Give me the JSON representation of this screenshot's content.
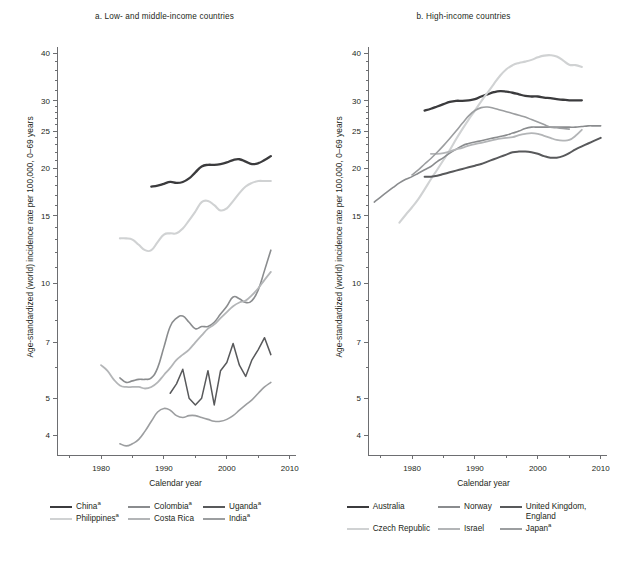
{
  "figure": {
    "background": "#ffffff",
    "text_color": "#231f20",
    "axis_color": "#6d6e71"
  },
  "axes": {
    "ylabel": "Age-standardized (world) incidence rate per 100,000, 0–69 years",
    "xlabel": "Calendar year",
    "y_ticks": [
      4,
      5,
      7,
      10,
      15,
      20,
      25,
      30,
      40
    ],
    "y_minor_ticks": [
      6,
      8,
      9,
      11,
      12,
      13,
      14,
      16,
      17,
      18,
      19,
      21,
      22,
      23,
      24,
      26,
      27,
      28,
      29,
      32,
      34,
      36,
      38
    ],
    "y_scale": "log",
    "ylim": [
      3.55,
      41.5
    ],
    "x_ticks": [
      1980,
      1990,
      2000,
      2010
    ],
    "x_minor_ticks": [
      1975,
      1985,
      1995,
      2005
    ],
    "xlim": [
      1973,
      2011
    ]
  },
  "panel_a": {
    "title": "a. Low- and middle-income countries",
    "legend": [
      {
        "label": "China",
        "superscript": "a",
        "color": "#3b3b3d",
        "width": 2.3
      },
      {
        "label": "Philippines",
        "superscript": "a",
        "color": "#d0d2d3",
        "width": 2.1
      },
      {
        "label": "Colombia",
        "superscript": "a",
        "color": "#8a8c8e",
        "width": 1.6
      },
      {
        "label": "Costa Rica",
        "superscript": "",
        "color": "#b3b5b7",
        "width": 1.8
      },
      {
        "label": "Uganda",
        "superscript": "a",
        "color": "#58595b",
        "width": 1.5
      },
      {
        "label": "India",
        "superscript": "a",
        "color": "#9c9ea0",
        "width": 1.6
      }
    ]
  },
  "panel_b": {
    "title": "b. High-income countries",
    "legend": [
      {
        "label": "Australia",
        "superscript": "",
        "color": "#3b3b3d",
        "width": 2.3
      },
      {
        "label": "Czech Republic",
        "superscript": "",
        "color": "#d0d2d3",
        "width": 2.1
      },
      {
        "label": "Norway",
        "superscript": "",
        "color": "#8a8c8e",
        "width": 1.6
      },
      {
        "label": "Israel",
        "superscript": "",
        "color": "#b3b5b7",
        "width": 1.8
      },
      {
        "label": "United Kingdom, England",
        "superscript": "",
        "color": "#58595b",
        "width": 2.0
      },
      {
        "label": "Japan",
        "superscript": "a",
        "color": "#9c9ea0",
        "width": 1.6
      }
    ]
  },
  "chart_data": [
    {
      "id": "panel_a",
      "type": "line",
      "title": "a. Low- and middle-income countries",
      "xlabel": "Calendar year",
      "ylabel": "Age-standardized (world) incidence rate per 100,000, 0–69 years",
      "yscale": "log",
      "ylim": [
        3.55,
        41.5
      ],
      "xlim": [
        1973,
        2011
      ],
      "yticks": [
        4,
        5,
        7,
        10,
        15,
        20,
        25,
        30,
        40
      ],
      "xticks": [
        1980,
        1990,
        2000,
        2010
      ],
      "grid": false,
      "legend_position": "below",
      "series": [
        {
          "name": "China",
          "color": "#3b3b3d",
          "x": [
            1988,
            1989,
            1990,
            1991,
            1992,
            1993,
            1994,
            1995,
            1996,
            1997,
            1998,
            1999,
            2000,
            2001,
            2002,
            2003,
            2004,
            2005,
            2006,
            2007
          ],
          "values": [
            17.9,
            18.0,
            18.2,
            18.4,
            18.3,
            18.4,
            18.8,
            19.5,
            20.2,
            20.4,
            20.4,
            20.5,
            20.7,
            21.0,
            21.1,
            20.8,
            20.5,
            20.6,
            21.0,
            21.5
          ]
        },
        {
          "name": "Philippines",
          "color": "#d0d2d3",
          "x": [
            1983,
            1984,
            1985,
            1986,
            1987,
            1988,
            1989,
            1990,
            1991,
            1992,
            1993,
            1994,
            1995,
            1996,
            1997,
            1998,
            1999,
            2000,
            2001,
            2002,
            2003,
            2004,
            2005,
            2006,
            2007
          ],
          "values": [
            13.1,
            13.1,
            13.0,
            12.6,
            12.2,
            12.2,
            12.8,
            13.4,
            13.5,
            13.5,
            13.9,
            14.6,
            15.4,
            16.3,
            16.4,
            16.0,
            15.5,
            15.7,
            16.4,
            17.2,
            17.9,
            18.3,
            18.5,
            18.5,
            18.5
          ]
        },
        {
          "name": "Colombia",
          "color": "#8a8c8e",
          "x": [
            1983,
            1984,
            1985,
            1986,
            1987,
            1988,
            1989,
            1990,
            1991,
            1992,
            1993,
            1994,
            1995,
            1996,
            1997,
            1998,
            1999,
            2000,
            2001,
            2002,
            2003,
            2004,
            2005,
            2006,
            2007
          ],
          "values": [
            5.65,
            5.5,
            5.55,
            5.6,
            5.6,
            5.65,
            6.0,
            6.8,
            7.7,
            8.1,
            8.2,
            7.9,
            7.6,
            7.7,
            7.7,
            7.9,
            8.3,
            8.7,
            9.2,
            9.1,
            8.9,
            9.0,
            9.6,
            10.8,
            12.2
          ]
        },
        {
          "name": "Costa Rica",
          "color": "#b3b5b7",
          "x": [
            1980,
            1981,
            1982,
            1983,
            1984,
            1985,
            1986,
            1987,
            1988,
            1989,
            1990,
            1991,
            1992,
            1993,
            1994,
            1995,
            1996,
            1997,
            1998,
            1999,
            2000,
            2001,
            2002,
            2003,
            2004,
            2005,
            2006,
            2007
          ],
          "values": [
            6.1,
            5.9,
            5.6,
            5.4,
            5.35,
            5.35,
            5.35,
            5.3,
            5.35,
            5.5,
            5.75,
            6.0,
            6.3,
            6.5,
            6.7,
            7.0,
            7.3,
            7.6,
            7.8,
            8.1,
            8.4,
            8.7,
            8.9,
            9.0,
            9.3,
            9.7,
            10.2,
            10.7
          ]
        },
        {
          "name": "Uganda",
          "color": "#58595b",
          "x": [
            1991,
            1992,
            1993,
            1994,
            1995,
            1996,
            1997,
            1998,
            1999,
            2000,
            2001,
            2002,
            2003,
            2004,
            2005,
            2006,
            2007
          ],
          "values": [
            5.15,
            5.45,
            5.95,
            5.0,
            4.8,
            5.0,
            5.9,
            4.8,
            5.9,
            6.2,
            6.95,
            6.1,
            5.7,
            6.3,
            6.7,
            7.2,
            6.5
          ]
        },
        {
          "name": "India",
          "color": "#9c9ea0",
          "x": [
            1983,
            1984,
            1985,
            1986,
            1987,
            1988,
            1989,
            1990,
            1991,
            1992,
            1993,
            1994,
            1995,
            1996,
            1997,
            1998,
            1999,
            2000,
            2001,
            2002,
            2003,
            2004,
            2005,
            2006,
            2007
          ],
          "values": [
            3.8,
            3.75,
            3.8,
            3.9,
            4.1,
            4.35,
            4.6,
            4.7,
            4.65,
            4.5,
            4.45,
            4.5,
            4.5,
            4.45,
            4.4,
            4.35,
            4.35,
            4.4,
            4.5,
            4.65,
            4.8,
            4.95,
            5.15,
            5.35,
            5.5
          ]
        }
      ]
    },
    {
      "id": "panel_b",
      "type": "line",
      "title": "b. High-income countries",
      "xlabel": "Calendar year",
      "ylabel": "Age-standardized (world) incidence rate per 100,000, 0–69 years",
      "yscale": "log",
      "ylim": [
        3.55,
        41.5
      ],
      "xlim": [
        1973,
        2011
      ],
      "yticks": [
        4,
        5,
        7,
        10,
        15,
        20,
        25,
        30,
        40
      ],
      "xticks": [
        1980,
        1990,
        2000,
        2010
      ],
      "grid": false,
      "legend_position": "below",
      "series": [
        {
          "name": "Australia",
          "color": "#3b3b3d",
          "x": [
            1982,
            1983,
            1984,
            1985,
            1986,
            1987,
            1988,
            1989,
            1990,
            1991,
            1992,
            1993,
            1994,
            1995,
            1996,
            1997,
            1998,
            1999,
            2000,
            2001,
            2002,
            2003,
            2004,
            2005,
            2006,
            2007
          ],
          "values": [
            28.3,
            28.6,
            29.0,
            29.4,
            29.8,
            30.0,
            30.0,
            30.1,
            30.3,
            30.8,
            31.2,
            31.6,
            31.8,
            31.7,
            31.5,
            31.2,
            30.9,
            30.8,
            30.8,
            30.6,
            30.5,
            30.3,
            30.2,
            30.1,
            30.1,
            30.1
          ]
        },
        {
          "name": "Czech Republic",
          "color": "#d0d2d3",
          "x": [
            1978,
            1979,
            1980,
            1981,
            1982,
            1983,
            1984,
            1985,
            1986,
            1987,
            1988,
            1989,
            1990,
            1991,
            1992,
            1993,
            1994,
            1995,
            1996,
            1997,
            1998,
            1999,
            2000,
            2001,
            2002,
            2003,
            2004,
            2005,
            2006,
            2007
          ],
          "values": [
            14.4,
            15.1,
            15.8,
            16.6,
            17.6,
            18.7,
            19.8,
            21.0,
            22.3,
            23.8,
            25.3,
            26.8,
            28.3,
            29.9,
            31.5,
            33.2,
            34.9,
            36.3,
            37.2,
            37.7,
            38.0,
            38.4,
            39.0,
            39.4,
            39.5,
            39.2,
            38.3,
            37.3,
            37.2,
            36.8
          ]
        },
        {
          "name": "Norway",
          "color": "#8a8c8e",
          "x": [
            1974,
            1975,
            1976,
            1977,
            1978,
            1979,
            1980,
            1981,
            1982,
            1983,
            1984,
            1985,
            1986,
            1987,
            1988,
            1989,
            1990,
            1991,
            1992,
            1993,
            1994,
            1995,
            1996,
            1997,
            1998,
            1999,
            2000,
            2001,
            2002,
            2003,
            2004,
            2005,
            2006,
            2007,
            2008,
            2009,
            2010
          ],
          "values": [
            16.3,
            16.8,
            17.3,
            17.8,
            18.3,
            18.7,
            19.0,
            19.4,
            19.8,
            20.2,
            20.8,
            21.3,
            21.9,
            22.4,
            22.9,
            23.2,
            23.4,
            23.6,
            23.8,
            24.0,
            24.2,
            24.4,
            24.7,
            25.0,
            25.4,
            25.6,
            25.6,
            25.6,
            25.6,
            25.6,
            25.6,
            25.6,
            25.6,
            25.7,
            25.8,
            25.8,
            25.8
          ]
        },
        {
          "name": "Israel",
          "color": "#b3b5b7",
          "x": [
            1983,
            1984,
            1985,
            1986,
            1987,
            1988,
            1989,
            1990,
            1991,
            1992,
            1993,
            1994,
            1995,
            1996,
            1997,
            1998,
            1999,
            2000,
            2001,
            2002,
            2003,
            2004,
            2005,
            2006,
            2007
          ],
          "values": [
            21.8,
            21.8,
            21.9,
            22.1,
            22.4,
            22.6,
            22.9,
            23.1,
            23.3,
            23.5,
            23.7,
            23.9,
            24.0,
            24.1,
            24.4,
            24.6,
            24.7,
            24.6,
            24.3,
            24.0,
            23.7,
            23.6,
            23.7,
            24.3,
            25.2
          ]
        },
        {
          "name": "United Kingdom, England",
          "color": "#58595b",
          "x": [
            1982,
            1983,
            1984,
            1985,
            1986,
            1987,
            1988,
            1989,
            1990,
            1991,
            1992,
            1993,
            1994,
            1995,
            1996,
            1997,
            1998,
            1999,
            2000,
            2001,
            2002,
            2003,
            2004,
            2005,
            2006,
            2007,
            2008,
            2009,
            2010
          ],
          "values": [
            19.0,
            19.0,
            19.1,
            19.3,
            19.5,
            19.7,
            19.9,
            20.1,
            20.3,
            20.5,
            20.8,
            21.1,
            21.4,
            21.7,
            22.0,
            22.1,
            22.1,
            22.0,
            21.8,
            21.5,
            21.3,
            21.3,
            21.5,
            21.9,
            22.4,
            22.8,
            23.2,
            23.6,
            24.0
          ]
        },
        {
          "name": "Japan",
          "color": "#9c9ea0",
          "x": [
            1980,
            1981,
            1982,
            1983,
            1984,
            1985,
            1986,
            1987,
            1988,
            1989,
            1990,
            1991,
            1992,
            1993,
            1994,
            1995,
            1996,
            1997,
            1998,
            1999,
            2000,
            2001,
            2002,
            2003,
            2004,
            2005
          ],
          "values": [
            19.2,
            19.8,
            20.5,
            21.2,
            22.0,
            22.9,
            23.9,
            25.0,
            26.2,
            27.4,
            28.3,
            28.8,
            28.9,
            28.7,
            28.4,
            28.1,
            27.8,
            27.5,
            27.2,
            26.8,
            26.4,
            26.0,
            25.6,
            25.5,
            25.4,
            25.3
          ]
        }
      ]
    }
  ]
}
